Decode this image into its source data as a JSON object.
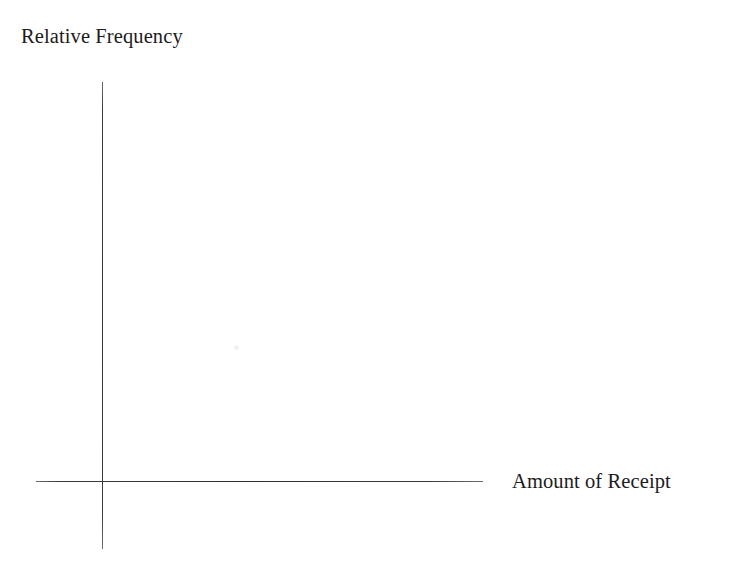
{
  "figure": {
    "background_color": "#ffffff",
    "line_color": "#3a3a3a",
    "text_color": "#1c1c1c",
    "y_axis_label": "Relative Frequency",
    "x_axis_label": "Amount of Receipt"
  },
  "chart_data": {
    "type": "scatter",
    "title": "",
    "subtitle": "",
    "xlabel": "Amount of Receipt",
    "ylabel": "Relative Frequency",
    "x": [],
    "values": [],
    "series": [],
    "categories": [],
    "xticklabels": [],
    "yticklabels": [],
    "xlim": [],
    "ylim": [],
    "grid": false,
    "legend": false,
    "legend_position": "none",
    "annotations": []
  }
}
